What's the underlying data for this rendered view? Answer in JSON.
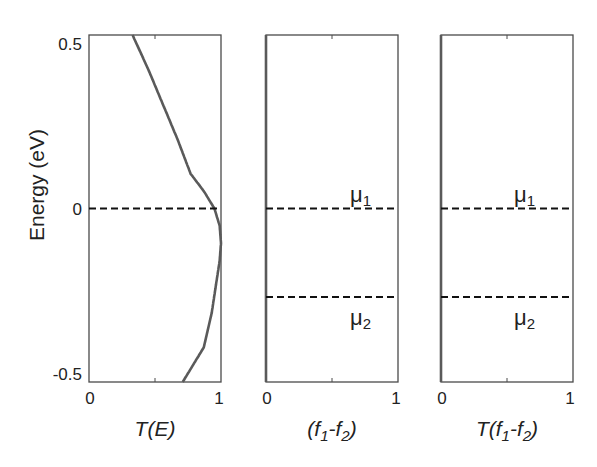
{
  "chart_data": {
    "type": "line",
    "layout": "three side-by-side panels sharing y axis",
    "ylabel": "Energy (eV)",
    "ylim": [
      -0.5,
      0.5
    ],
    "yticks": [
      "0.5",
      "0",
      "-0.5"
    ],
    "grid": false,
    "legend": null,
    "panels": [
      {
        "xlabel": "T(E)",
        "xlim": [
          0,
          1
        ],
        "xticks": [
          "0",
          "1"
        ],
        "dashed_lines": [
          {
            "y": 0,
            "label": null
          }
        ],
        "series": [
          {
            "name": "T(E)",
            "points": [
              [
                0.33,
                0.5
              ],
              [
                0.45,
                0.4
              ],
              [
                0.56,
                0.3
              ],
              [
                0.67,
                0.2
              ],
              [
                0.77,
                0.1
              ],
              [
                0.87,
                0.05
              ],
              [
                0.95,
                0.0
              ],
              [
                0.99,
                -0.05
              ],
              [
                1.0,
                -0.1
              ],
              [
                0.99,
                -0.15
              ],
              [
                0.97,
                -0.2
              ],
              [
                0.93,
                -0.3
              ],
              [
                0.87,
                -0.4
              ],
              [
                0.71,
                -0.5
              ]
            ]
          }
        ]
      },
      {
        "xlabel": "(f1-f2)",
        "xlim": [
          0,
          1
        ],
        "xticks": [
          "0",
          "1"
        ],
        "dashed_lines": [
          {
            "y": 0,
            "label": "μ1"
          },
          {
            "y": -0.255,
            "label": "μ2"
          }
        ],
        "series": [
          {
            "name": "f1-f2",
            "mu1": 0,
            "mu2": -0.255,
            "kT": 0.025
          }
        ]
      },
      {
        "xlabel": "T(f1-f2)",
        "xlim": [
          0,
          1
        ],
        "xticks": [
          "0",
          "1"
        ],
        "dashed_lines": [
          {
            "y": 0,
            "label": "μ1"
          },
          {
            "y": -0.255,
            "label": "μ2"
          }
        ],
        "series": [
          {
            "name": "T·(f1-f2)",
            "mu1": 0,
            "mu2": -0.255,
            "kT": 0.025
          }
        ]
      }
    ]
  },
  "labels": {
    "ylabel": "Energy (eV)",
    "ytick_top": "0.5",
    "ytick_mid": "0",
    "ytick_bot": "-0.5",
    "x0": "0",
    "x1": "1",
    "xlabel1": "T(E)",
    "mu": "μ",
    "sub1": "1",
    "sub2": "2"
  }
}
